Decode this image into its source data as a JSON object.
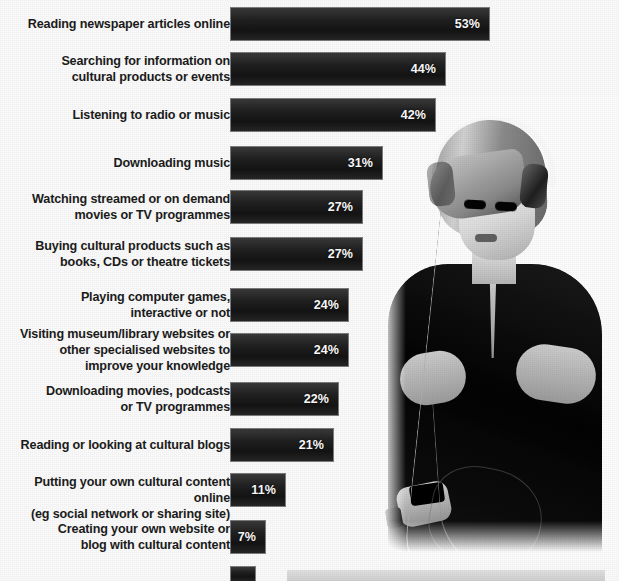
{
  "chart_data": {
    "type": "bar",
    "orientation": "horizontal",
    "title": "",
    "xlabel": "",
    "ylabel": "",
    "xlim": [
      0,
      60
    ],
    "grid": false,
    "legend": null,
    "value_suffix": "%",
    "categories": [
      "Reading newspaper articles online",
      "Searching for information on\ncultural products or events",
      "Listening to radio or music",
      "Downloading music",
      "Watching streamed or on demand\nmovies or TV programmes",
      "Buying cultural products such as\nbooks, CDs or theatre tickets",
      "Playing computer games,\ninteractive or not",
      "Visiting museum/library websites or\nother specialised websites to\nimprove your knowledge",
      "Downloading movies, podcasts\nor TV programmes",
      "Reading or looking at cultural blogs",
      "Putting your own cultural content online\n(eg social network or sharing site)",
      "Creating your own website or\nblog with cultural content"
    ],
    "values": [
      53,
      44,
      42,
      31,
      27,
      27,
      24,
      24,
      22,
      21,
      11,
      7
    ],
    "value_labels": [
      "53%",
      "44%",
      "42%",
      "31%",
      "27%",
      "27%",
      "24%",
      "24%",
      "22%",
      "21%",
      "11%",
      "7%"
    ],
    "bar_color": "#1a1a1a",
    "value_label_color": "#ffffff",
    "category_label_color": "#1c1c1c"
  },
  "rows": [
    {
      "label": "Reading newspaper articles online",
      "value": "53%",
      "pct": 53,
      "top": 8,
      "lines": 1
    },
    {
      "label": "Searching for information on\ncultural products or events",
      "value": "44%",
      "pct": 44,
      "top": 53,
      "lines": 2
    },
    {
      "label": "Listening to radio or music",
      "value": "42%",
      "pct": 42,
      "top": 99,
      "lines": 1
    },
    {
      "label": "Downloading music",
      "value": "31%",
      "pct": 31,
      "top": 147,
      "lines": 1
    },
    {
      "label": "Watching streamed or on demand\nmovies or TV programmes",
      "value": "27%",
      "pct": 27,
      "top": 191,
      "lines": 2
    },
    {
      "label": "Buying cultural products such as\nbooks, CDs or theatre tickets",
      "value": "27%",
      "pct": 27,
      "top": 238,
      "lines": 2
    },
    {
      "label": "Playing computer games,\ninteractive or not",
      "value": "24%",
      "pct": 24,
      "top": 289,
      "lines": 2
    },
    {
      "label": "Visiting museum/library websites or\nother specialised websites to\nimprove your knowledge",
      "value": "24%",
      "pct": 24,
      "top": 334,
      "lines": 3
    },
    {
      "label": "Downloading movies, podcasts\nor TV programmes",
      "value": "22%",
      "pct": 22,
      "top": 383,
      "lines": 2
    },
    {
      "label": "Reading or looking at cultural blogs",
      "value": "21%",
      "pct": 21,
      "top": 429,
      "lines": 1
    },
    {
      "label": "Putting your own cultural content online\n(eg social network or sharing site)",
      "value": "11%",
      "pct": 11,
      "top": 474,
      "lines": 2
    },
    {
      "label": "Creating your own website or\nblog with cultural content",
      "value": "7%",
      "pct": 7,
      "top": 521,
      "lines": 2
    }
  ],
  "partial_row": {
    "label": "",
    "value": "",
    "pct": 5,
    "top": 567
  },
  "photo": {
    "alt": "woman-with-headphones-using-phone"
  },
  "colors": {
    "bar": "#1a1a1a",
    "page_background": "#ffffff",
    "label_text": "#1c1c1c",
    "value_text": "#ffffff",
    "bottom_panel": "#dcdcdc"
  }
}
